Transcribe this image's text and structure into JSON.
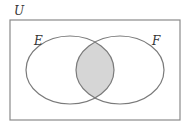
{
  "diagram": {
    "type": "venn",
    "universe_label": "U",
    "sets": [
      {
        "label": "E"
      },
      {
        "label": "F"
      }
    ],
    "shaded_region": "E ∩ F",
    "colors": {
      "stroke": "#7a7a7a",
      "shade": "#d6d6d6",
      "background": "#ffffff"
    }
  }
}
